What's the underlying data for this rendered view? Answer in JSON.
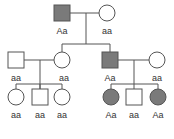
{
  "diagram": {
    "type": "pedigree",
    "colors": {
      "affected": "#7a7a7a",
      "unaffected": "#ffffff",
      "line": "#444444"
    },
    "generation1": [
      {
        "sex": "male",
        "affected": true,
        "genotype": "Aa"
      },
      {
        "sex": "female",
        "affected": false,
        "genotype": "aa"
      }
    ],
    "generation2": [
      {
        "sex": "male",
        "affected": false,
        "genotype": "aa"
      },
      {
        "sex": "female",
        "affected": false,
        "genotype": "aa"
      },
      {
        "sex": "male",
        "affected": true,
        "genotype": "Aa"
      },
      {
        "sex": "female",
        "affected": false,
        "genotype": "aa"
      }
    ],
    "generation3": [
      {
        "sex": "female",
        "affected": false,
        "genotype": "aa"
      },
      {
        "sex": "male",
        "affected": false,
        "genotype": "aa"
      },
      {
        "sex": "female",
        "affected": false,
        "genotype": "aa"
      },
      {
        "sex": "female",
        "affected": true,
        "genotype": "Aa"
      },
      {
        "sex": "male",
        "affected": false,
        "genotype": "aa"
      },
      {
        "sex": "female",
        "affected": true,
        "genotype": "Aa"
      }
    ]
  }
}
